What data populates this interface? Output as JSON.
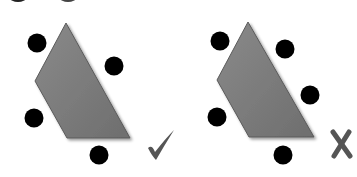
{
  "figures": [
    {
      "id": "correct",
      "verdict": "correct",
      "verdict_icon": "check-icon",
      "shape": "quadrilateral",
      "dots_count": 4
    },
    {
      "id": "incorrect",
      "verdict": "incorrect",
      "verdict_icon": "x-icon",
      "shape": "quadrilateral",
      "dots_count": 5
    }
  ],
  "colors": {
    "shape_fill": "#7a7a7a",
    "shape_edge": "#4a4a4a",
    "dot": "#000000",
    "mark": "#555555"
  }
}
